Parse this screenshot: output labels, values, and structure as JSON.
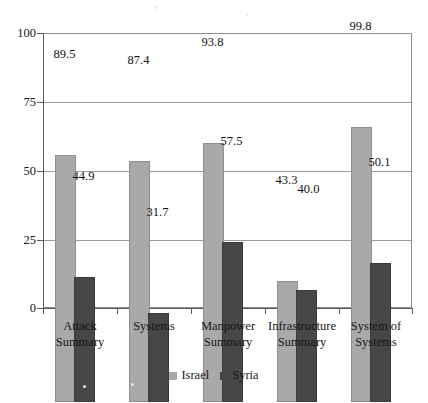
{
  "chart_data": {
    "type": "bar",
    "title": "",
    "subtitle": "",
    "xlabel": "",
    "ylabel": "",
    "ylim": [
      0,
      100
    ],
    "yticks": [
      0,
      25,
      50,
      75,
      100
    ],
    "ytick_labels": [
      "0",
      "25",
      "50",
      "75",
      "100"
    ],
    "grid": true,
    "legend_position": "bottom",
    "categories": [
      "Attack Summary",
      "Systems",
      "Manpower Summary",
      "Infrastructure Summary",
      "System of Systems"
    ],
    "category_lines": [
      [
        "Attack",
        "Summary"
      ],
      [
        "Systems"
      ],
      [
        "Manpower",
        "Summary"
      ],
      [
        "Infrastructure",
        "Summary"
      ],
      [
        "System of",
        "Systems"
      ]
    ],
    "series": [
      {
        "name": "Israel",
        "color": "#a9a9a9",
        "values": [
          89.5,
          87.4,
          93.8,
          43.3,
          99.8
        ],
        "value_labels": [
          "89.5",
          "87.4",
          "93.8",
          "43.3",
          "99.8"
        ]
      },
      {
        "name": "Syria",
        "color": "#474747",
        "values": [
          44.9,
          31.7,
          57.5,
          40.0,
          50.1
        ],
        "value_labels": [
          "44.9",
          "31.7",
          "57.5",
          "40.0",
          "50.1"
        ]
      }
    ]
  },
  "legend": {
    "items": [
      {
        "label": "Israel",
        "swatch": "israel"
      },
      {
        "label": "Syria",
        "swatch": "syria"
      }
    ]
  }
}
